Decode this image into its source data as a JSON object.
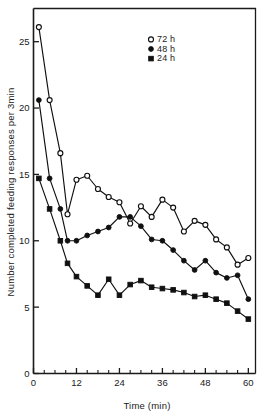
{
  "chart_data": {
    "type": "line",
    "title": "",
    "xlabel": "Time (min)",
    "ylabel": "Number completed feeding responses per 3min",
    "xlim": [
      0,
      62
    ],
    "ylim": [
      0,
      27.5
    ],
    "xticks": [
      0,
      12,
      24,
      36,
      48,
      60
    ],
    "xticklabels": [
      "0",
      "12",
      "24",
      "36",
      "48",
      "60"
    ],
    "xminorticks": [
      3,
      6,
      9,
      15,
      18,
      21,
      27,
      30,
      33,
      39,
      42,
      45,
      51,
      54,
      57
    ],
    "yticks": [
      0,
      5,
      10,
      15,
      20,
      25
    ],
    "yticklabels": [
      "0",
      "5",
      "10",
      "15",
      "20",
      "25"
    ],
    "grid": false,
    "legend_position": "top-right",
    "series": [
      {
        "name": "72 h",
        "marker": "open-circle",
        "x": [
          1.5,
          4.5,
          7.5,
          9.5,
          12,
          15,
          18,
          21,
          24,
          27,
          30,
          33,
          36,
          39,
          42,
          45,
          48,
          51,
          54,
          57,
          60
        ],
        "y": [
          26.1,
          20.6,
          16.6,
          12.0,
          14.6,
          14.9,
          13.9,
          13.3,
          12.9,
          11.3,
          12.6,
          11.8,
          13.1,
          12.5,
          10.7,
          11.5,
          11.2,
          10.1,
          9.5,
          8.2,
          8.7
        ]
      },
      {
        "name": "48 h",
        "marker": "filled-circle",
        "x": [
          1.5,
          4.5,
          7.5,
          9.5,
          12,
          15,
          18,
          21,
          24,
          27,
          30,
          33,
          36,
          39,
          42,
          45,
          48,
          51,
          54,
          57,
          60
        ],
        "y": [
          20.6,
          14.7,
          12.4,
          10.0,
          10.0,
          10.4,
          10.7,
          11.0,
          11.8,
          11.8,
          11.1,
          10.1,
          10.0,
          9.3,
          8.5,
          7.8,
          8.5,
          7.6,
          7.2,
          7.4,
          5.6
        ]
      },
      {
        "name": "24 h",
        "marker": "filled-square",
        "x": [
          1.5,
          4.5,
          7.5,
          9.5,
          12,
          15,
          18,
          21,
          24,
          27,
          30,
          33,
          36,
          39,
          42,
          45,
          48,
          51,
          54,
          57,
          60
        ],
        "y": [
          14.7,
          12.4,
          10.0,
          8.3,
          7.3,
          6.6,
          5.9,
          7.1,
          5.9,
          6.7,
          7.0,
          6.5,
          6.4,
          6.3,
          6.1,
          5.8,
          5.9,
          5.6,
          5.3,
          4.7,
          4.1
        ]
      }
    ],
    "legend": [
      {
        "label": "72 h",
        "marker": "open-circle"
      },
      {
        "label": "48 h",
        "marker": "filled-circle"
      },
      {
        "label": "24 h",
        "marker": "filled-square"
      }
    ]
  }
}
